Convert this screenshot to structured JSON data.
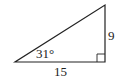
{
  "diagram": {
    "type": "right-triangle",
    "angle_label": "31°",
    "opposite_side_label": "9",
    "adjacent_side_label": "15",
    "right_angle_marker": true,
    "stroke_color": "#222222"
  }
}
